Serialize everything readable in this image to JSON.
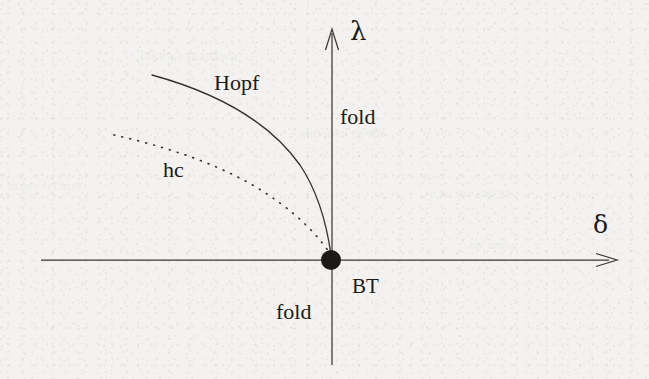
{
  "figure": {
    "kind": "bifurcation-diagram",
    "caption_text": "",
    "background_color": "#f3f2f0",
    "ink_color": "#2a2826",
    "axes": {
      "horizontal": {
        "name": "delta-axis",
        "label": "δ",
        "label_x": 595,
        "label_y": 212,
        "x_start": 41,
        "x_end": 617,
        "y": 260,
        "arrow": "right"
      },
      "vertical": {
        "name": "lambda-axis",
        "label": "λ",
        "label_x": 350,
        "label_y": 16,
        "y_start": 365,
        "y_end": 29,
        "x": 332,
        "arrow": "up"
      }
    },
    "origin_point": {
      "name": "bogdanov-takens-point",
      "label": "BT",
      "cx": 331,
      "cy": 260,
      "r": 10,
      "fill": "#1b1a18",
      "label_x": 352,
      "label_y": 274
    },
    "curves": [
      {
        "name": "hopf-curve",
        "label": "Hopf",
        "style": "solid",
        "label_x": 214,
        "label_y": 70,
        "path": "M 152 75 C 214 92, 268 120, 300 165 C 318 192, 327 226, 331 255",
        "stroke_width": 1.35
      },
      {
        "name": "homoclinic-curve",
        "label": "hc",
        "style": "dotted",
        "label_x": 163,
        "label_y": 157,
        "path": "M 114 135 C 168 147, 226 166, 270 196 C 300 216, 320 238, 331 255",
        "stroke_width": 1.7,
        "dash": "0.8 7.4"
      }
    ],
    "region_labels": [
      {
        "name": "fold-label-upper",
        "text": "fold",
        "x": 340,
        "y": 104
      },
      {
        "name": "fold-label-lower",
        "text": "fold",
        "x": 276,
        "y": 299
      }
    ],
    "bleed_through_text": [
      {
        "text": "lakawa manawa",
        "x": 140,
        "y": 48,
        "size": 14
      },
      {
        "text": "and area of the",
        "x": 300,
        "y": 126,
        "size": 13
      },
      {
        "text": "mque lecture",
        "x": 8,
        "y": 178,
        "size": 13
      },
      {
        "text": "a nu ma ang na",
        "x": 430,
        "y": 186,
        "size": 12
      },
      {
        "text": "tar mana",
        "x": 470,
        "y": 238,
        "size": 12
      }
    ]
  }
}
